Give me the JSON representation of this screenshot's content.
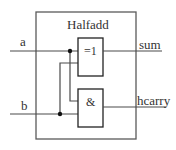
{
  "diagram": {
    "title": "Halfadd",
    "inputs": [
      {
        "label": "a"
      },
      {
        "label": "b"
      }
    ],
    "outputs": [
      {
        "label": "sum"
      },
      {
        "label": "hcarry"
      }
    ],
    "gates": [
      {
        "id": "xor",
        "symbol": "=1"
      },
      {
        "id": "and",
        "symbol": "&"
      }
    ],
    "colors": {
      "wire": "#4a4a4a",
      "box": "#5a5a5a",
      "gate": "#222222",
      "junction": "#111111",
      "text": "#333333",
      "background": "#ffffff"
    }
  }
}
